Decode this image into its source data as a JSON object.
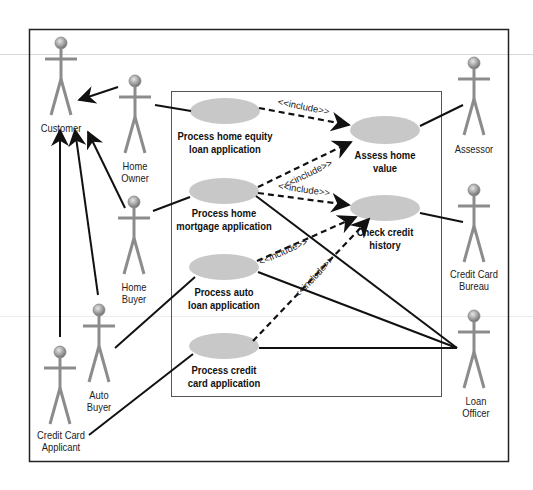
{
  "colors": {
    "usecase_fill": "#c8c8c8",
    "actor_stroke": "#8c8c8c",
    "line": "#111111",
    "border": "#222222"
  },
  "actors": [
    {
      "id": "customer",
      "lines": [
        "Customer"
      ]
    },
    {
      "id": "home-owner",
      "lines": [
        "Home",
        "Owner"
      ]
    },
    {
      "id": "home-buyer",
      "lines": [
        "Home",
        "Buyer"
      ]
    },
    {
      "id": "auto-buyer",
      "lines": [
        "Auto",
        "Buyer"
      ]
    },
    {
      "id": "credit-card-applicant",
      "lines": [
        "Credit Card",
        "Applicant"
      ]
    },
    {
      "id": "assessor",
      "lines": [
        "Assessor"
      ]
    },
    {
      "id": "credit-card-bureau",
      "lines": [
        "Credit Card",
        "Bureau"
      ]
    },
    {
      "id": "loan-officer",
      "lines": [
        "Loan",
        "Officer"
      ]
    }
  ],
  "use_cases": [
    {
      "id": "process-home-equity",
      "lines": [
        "Process home equity",
        "loan application"
      ]
    },
    {
      "id": "process-home-mortgage",
      "lines": [
        "Process home",
        "mortgage application"
      ]
    },
    {
      "id": "process-auto-loan",
      "lines": [
        "Process auto",
        "loan application"
      ]
    },
    {
      "id": "process-credit-card",
      "lines": [
        "Process credit",
        "card application"
      ]
    },
    {
      "id": "assess-home-value",
      "lines": [
        "Assess home",
        "value"
      ]
    },
    {
      "id": "check-credit-history",
      "lines": [
        "Check credit",
        "history"
      ]
    }
  ],
  "relationships": {
    "include_label": "<<include>>",
    "includes": [
      {
        "from": "Process home equity loan application",
        "to": "Assess home value"
      },
      {
        "from": "Process home mortgage application",
        "to": "Assess home value"
      },
      {
        "from": "Process home mortgage application",
        "to": "Check credit history"
      },
      {
        "from": "Process auto loan application",
        "to": "Check credit history"
      },
      {
        "from": "Process credit card application",
        "to": "Check credit history"
      }
    ],
    "generalizations": [
      {
        "child": "Home Owner",
        "parent": "Customer"
      },
      {
        "child": "Home Buyer",
        "parent": "Customer"
      },
      {
        "child": "Auto Buyer",
        "parent": "Customer"
      },
      {
        "child": "Credit Card Applicant",
        "parent": "Customer"
      }
    ],
    "associations": [
      {
        "actor": "Home Owner",
        "use_case": "Process home equity loan application"
      },
      {
        "actor": "Home Buyer",
        "use_case": "Process home mortgage application"
      },
      {
        "actor": "Auto Buyer",
        "use_case": "Process auto loan application"
      },
      {
        "actor": "Credit Card Applicant",
        "use_case": "Process credit card application"
      },
      {
        "actor": "Assessor",
        "use_case": "Assess home value"
      },
      {
        "actor": "Credit Card Bureau",
        "use_case": "Check credit history"
      },
      {
        "actor": "Loan Officer",
        "use_case": "Process home mortgage application"
      },
      {
        "actor": "Loan Officer",
        "use_case": "Process auto loan application"
      },
      {
        "actor": "Loan Officer",
        "use_case": "Process credit card application"
      }
    ]
  }
}
